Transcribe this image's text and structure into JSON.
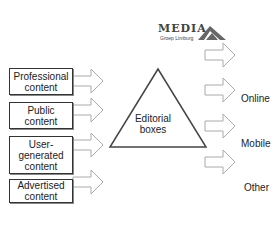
{
  "logo": {
    "name": "MEDIA",
    "subtitle": "Groep Limburg"
  },
  "inputs": [
    {
      "label": "Professional content"
    },
    {
      "label": "Public content"
    },
    {
      "label": "User-generated content"
    },
    {
      "label": "Advertised content"
    }
  ],
  "center": {
    "label": "Editorial boxes"
  },
  "outputs": [
    {
      "label": "Online"
    },
    {
      "label": "Mobile"
    },
    {
      "label": "Other"
    }
  ],
  "colors": {
    "border": "#333333",
    "arrow": "#aaaaaa",
    "text": "#222222"
  }
}
